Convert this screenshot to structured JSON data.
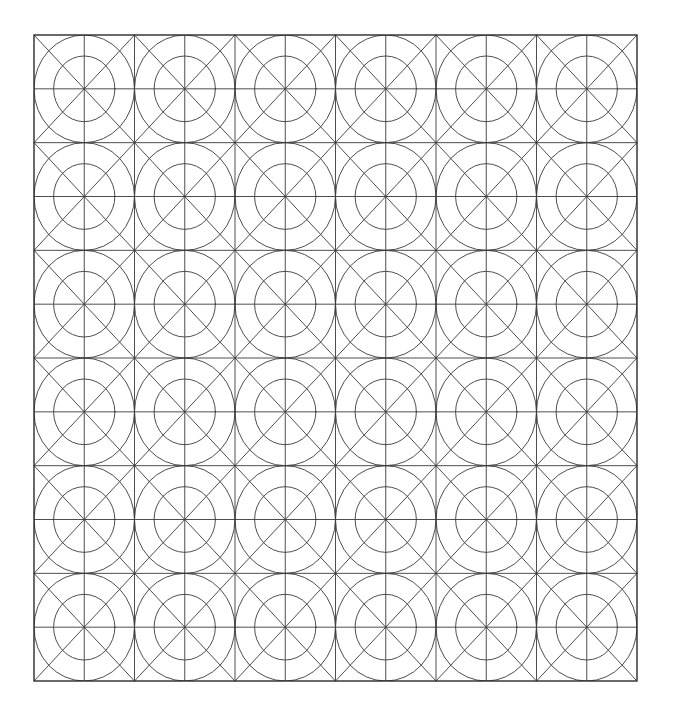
{
  "figure": {
    "title": "Geometric grid pattern",
    "background_color": "#ffffff",
    "canvas_width": 675,
    "canvas_height": 716
  },
  "chart_data": {
    "type": "diagram",
    "title": "Geometric grid pattern",
    "grid": {
      "columns": 6,
      "rows": 6,
      "left": 34,
      "top": 35,
      "right": 637,
      "bottom": 681,
      "width": 603,
      "height": 646,
      "cell_width": 100.5,
      "cell_height": 107.67
    },
    "cell_elements": [
      "square-border",
      "diagonal-tl-br",
      "diagonal-tr-bl",
      "horizontal-midline",
      "vertical-midline",
      "outer-circle",
      "inner-circle"
    ],
    "outer_circle_radius_ratio": 0.5,
    "inner_circle_radius_ratio": 0.305,
    "stroke_color": "#3a3a3a",
    "border_stroke_color": "#2b2b2b",
    "stroke_width": 0.9,
    "border_stroke_width": 1.4,
    "column_x_positions": [
      34,
      134.5,
      235,
      335.5,
      436,
      536.5,
      637
    ],
    "row_y_positions": [
      35,
      142.67,
      250.33,
      358,
      465.67,
      573.33,
      681
    ]
  }
}
